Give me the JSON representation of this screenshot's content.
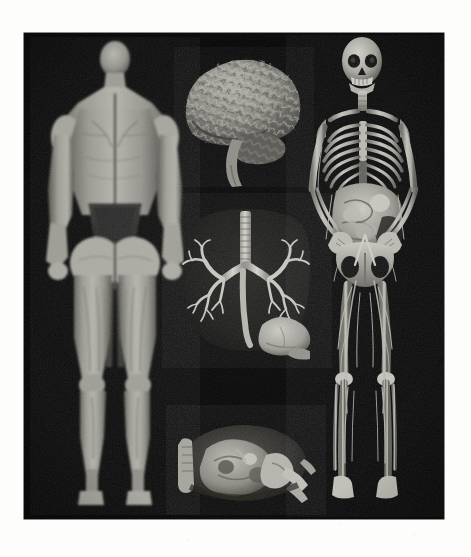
{
  "figure": {
    "medium": "scanned printed photographic plate",
    "plate_background_color": "#050505",
    "page_background_color": "#fdfdfc",
    "rendering_style": "grayscale volume rendering",
    "caption_text": ""
  },
  "panels": [
    {
      "id": "muscular-figure",
      "label": "Muscular system, posterior full-body view",
      "subject": "whole-body muscle volume rendering, arms at sides, viewed from the back",
      "position": "left column, full height",
      "tone_highlight": "#b9b8b1",
      "tone_midtone": "#8c8b84",
      "tone_shadow": "#3d3c38"
    },
    {
      "id": "brain",
      "label": "Brain, lateral view",
      "subject": "cerebral hemisphere with gyri and sulci, cerebellum and brainstem",
      "position": "center column, upper",
      "tone_highlight": "#a7a69f",
      "tone_midtone": "#7b7a74",
      "tone_shadow": "#2e2d2a"
    },
    {
      "id": "thorax-airways",
      "label": "Thorax, trachea and bronchial tree",
      "subject": "coronal thoracic volume showing trachea, carina, left and right bronchial trees within dark lung fields, with liver and stomach below",
      "position": "center column, middle",
      "tone_highlight": "#cfcec6",
      "tone_midtone": "#7a7973",
      "tone_shadow": "#141413"
    },
    {
      "id": "abdominal-section",
      "label": "Abdominal cross-section",
      "subject": "oblique transverse abdominal slab showing viscera, vertebra and ribs",
      "position": "center column, lower",
      "tone_highlight": "#c4c3bb",
      "tone_midtone": "#6e6d67",
      "tone_shadow": "#131312"
    },
    {
      "id": "skeletal-figure",
      "label": "Skeletal and vascular system, anterior full-body view",
      "subject": "whole-body skeleton with skull, rib cage, pelvis and limb bones, abdominal viscera and peripheral vasculature visible",
      "position": "right column, full height",
      "tone_highlight": "#cdccc4",
      "tone_midtone": "#8e8d86",
      "tone_shadow": "#2a2a27"
    }
  ]
}
